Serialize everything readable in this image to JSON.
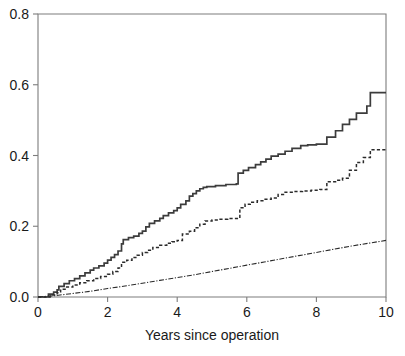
{
  "chart_data": {
    "type": "line",
    "title": "",
    "subtitle": "",
    "xlabel": "Years since operation",
    "ylabel": "",
    "xlim": [
      0,
      10
    ],
    "ylim": [
      0.0,
      0.8
    ],
    "grid": false,
    "legend": "none",
    "xticks": [
      0,
      2,
      4,
      6,
      8,
      10
    ],
    "xtick_labels": [
      "0",
      "2",
      "4",
      "6",
      "8",
      "10"
    ],
    "yticks": [
      0.0,
      0.2,
      0.4,
      0.6,
      0.8
    ],
    "ytick_labels": [
      "0.0",
      "0.2",
      "0.4",
      "0.6",
      "0.8"
    ],
    "frame": "box",
    "series": [
      {
        "name": "solid-step-curve",
        "style": "solid",
        "drawstyle": "steps-post",
        "color": "#3c3c3c",
        "x": [
          0.0,
          0.3,
          0.45,
          0.55,
          0.6,
          0.75,
          0.9,
          1.05,
          1.2,
          1.35,
          1.5,
          1.6,
          1.75,
          1.9,
          2.0,
          2.1,
          2.2,
          2.3,
          2.4,
          2.45,
          2.6,
          2.75,
          2.9,
          3.0,
          3.1,
          3.2,
          3.35,
          3.5,
          3.6,
          3.75,
          3.9,
          4.0,
          4.1,
          4.25,
          4.35,
          4.45,
          4.55,
          4.65,
          4.75,
          4.85,
          5.1,
          5.4,
          5.7,
          5.75,
          5.9,
          6.05,
          6.25,
          6.4,
          6.55,
          6.7,
          6.9,
          7.1,
          7.3,
          7.55,
          7.75,
          8.0,
          8.3,
          8.55,
          8.75,
          8.95,
          9.15,
          9.45,
          9.55,
          10.0
        ],
        "y": [
          0.0,
          0.008,
          0.014,
          0.02,
          0.03,
          0.038,
          0.046,
          0.052,
          0.06,
          0.068,
          0.076,
          0.082,
          0.088,
          0.096,
          0.104,
          0.112,
          0.12,
          0.13,
          0.15,
          0.162,
          0.168,
          0.172,
          0.18,
          0.186,
          0.198,
          0.208,
          0.215,
          0.222,
          0.23,
          0.238,
          0.244,
          0.252,
          0.262,
          0.272,
          0.285,
          0.292,
          0.3,
          0.306,
          0.31,
          0.312,
          0.315,
          0.318,
          0.32,
          0.35,
          0.358,
          0.366,
          0.374,
          0.382,
          0.39,
          0.398,
          0.404,
          0.412,
          0.42,
          0.428,
          0.43,
          0.432,
          0.452,
          0.47,
          0.488,
          0.502,
          0.52,
          0.54,
          0.578,
          0.578
        ]
      },
      {
        "name": "dashed-step-curve",
        "style": "dashed",
        "drawstyle": "steps-post",
        "color": "#2b2b2b",
        "x": [
          0.0,
          0.35,
          0.55,
          0.65,
          0.8,
          1.0,
          1.2,
          1.4,
          1.6,
          1.8,
          2.0,
          2.15,
          2.3,
          2.4,
          2.55,
          2.7,
          2.85,
          3.0,
          3.15,
          3.3,
          3.5,
          3.7,
          3.85,
          4.0,
          4.15,
          4.35,
          4.5,
          4.65,
          4.8,
          5.0,
          5.2,
          5.45,
          5.7,
          5.8,
          5.95,
          6.1,
          6.3,
          6.5,
          6.7,
          6.9,
          7.1,
          7.35,
          7.6,
          7.85,
          8.1,
          8.3,
          8.55,
          8.75,
          8.95,
          9.15,
          9.35,
          9.55,
          10.0
        ],
        "y": [
          0.0,
          0.006,
          0.012,
          0.022,
          0.028,
          0.034,
          0.04,
          0.046,
          0.052,
          0.058,
          0.064,
          0.072,
          0.082,
          0.098,
          0.104,
          0.112,
          0.118,
          0.126,
          0.132,
          0.14,
          0.146,
          0.152,
          0.156,
          0.16,
          0.178,
          0.186,
          0.196,
          0.206,
          0.215,
          0.218,
          0.22,
          0.222,
          0.222,
          0.252,
          0.262,
          0.268,
          0.272,
          0.276,
          0.28,
          0.29,
          0.296,
          0.298,
          0.3,
          0.302,
          0.304,
          0.326,
          0.33,
          0.336,
          0.358,
          0.38,
          0.394,
          0.416,
          0.416
        ]
      },
      {
        "name": "dashdot-smooth-curve",
        "style": "dashdot",
        "drawstyle": "default",
        "color": "#2b2b2b",
        "x": [
          0.0,
          0.5,
          1.0,
          1.5,
          2.0,
          2.5,
          3.0,
          3.5,
          4.0,
          4.5,
          5.0,
          5.5,
          6.0,
          6.5,
          7.0,
          7.5,
          8.0,
          8.5,
          9.0,
          9.5,
          10.0
        ],
        "y": [
          0.0,
          0.004,
          0.01,
          0.016,
          0.024,
          0.031,
          0.039,
          0.047,
          0.055,
          0.063,
          0.072,
          0.081,
          0.09,
          0.099,
          0.108,
          0.117,
          0.126,
          0.135,
          0.144,
          0.152,
          0.16
        ]
      }
    ]
  },
  "axes": {
    "x_title": "Years since operation"
  },
  "geometry": {
    "left": 38,
    "right": 386,
    "top": 14,
    "bottom": 297
  }
}
